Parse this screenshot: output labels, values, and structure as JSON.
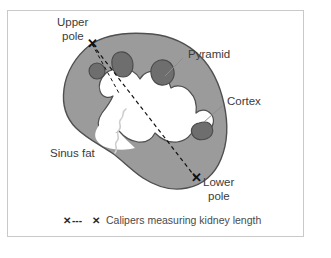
{
  "figure": {
    "title_text": "",
    "background_color": "#ffffff",
    "frame_color": "#c9c9c9"
  },
  "colors": {
    "cortex_fill": "#9b9b9b",
    "cortex_stroke": "#4f4f4f",
    "pyramid_fill": "#6e6e6e",
    "pyramid_stroke": "#4a4a4a",
    "sinus_fill": "#ffffff",
    "caliper_line": "#111111",
    "leader_line": "#8d8d8d",
    "sinus_leader_line": "#cfcfcf",
    "label_text": "#3b3b3b",
    "legend_text": "#4a4a4a"
  },
  "labels": {
    "upper_pole_line1": "Upper",
    "upper_pole_line2": "pole",
    "pyramid": "Pyramid",
    "cortex": "Cortex",
    "sinus_fat": "Sinus fat",
    "lower_pole_line1": "Lower",
    "lower_pole_line2": "pole"
  },
  "markers": {
    "upper_pole_glyph": "✕",
    "lower_pole_glyph": "✕"
  },
  "legend": {
    "marker_left": "✕",
    "marker_dashes": "---",
    "marker_right": "✕",
    "text": "Calipers measuring kidney length"
  },
  "anatomy": {
    "structures": [
      "cortex",
      "pyramid",
      "sinus fat",
      "upper pole",
      "lower pole"
    ],
    "measurement": "kidney length"
  }
}
